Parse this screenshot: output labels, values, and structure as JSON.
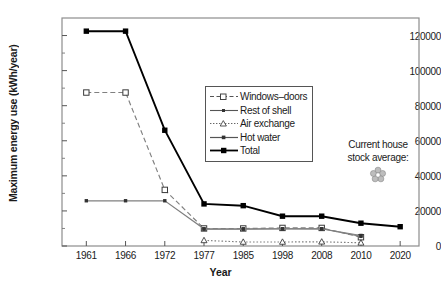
{
  "chart_data": {
    "type": "line",
    "title": "",
    "xlabel": "Year",
    "ylabel": "Maximum energy use (kWh/year)",
    "categories": [
      "1961",
      "1966",
      "1972",
      "1977",
      "1985",
      "1998",
      "2008",
      "2010",
      "2020"
    ],
    "ylim": [
      0,
      130000
    ],
    "yticks": [
      0,
      20000,
      40000,
      60000,
      80000,
      100000,
      120000
    ],
    "ytick_labels": [
      "0",
      "20000",
      "40000",
      "60000",
      "80000",
      "100000",
      "120000"
    ],
    "grid": false,
    "legend_position": "center",
    "series": [
      {
        "name": "Windows–doors",
        "marker": "open-square",
        "line_style": "dashed",
        "color": "#808080",
        "values": [
          87500,
          87500,
          32000,
          10000,
          10000,
          10300,
          10300,
          5000,
          null
        ]
      },
      {
        "name": "Rest of shell",
        "marker": "small-dot",
        "line_style": "solid",
        "color": "#808080",
        "values": [
          25800,
          25800,
          25800,
          9800,
          9800,
          9800,
          9800,
          6000,
          null
        ]
      },
      {
        "name": "Air exchange",
        "marker": "open-triangle",
        "line_style": "dotted",
        "color": "#808080",
        "values": [
          null,
          null,
          null,
          3200,
          2300,
          2300,
          2400,
          1800,
          null
        ]
      },
      {
        "name": "Hot water",
        "marker": "small-dot",
        "line_style": "solid",
        "color": "#808080",
        "values": [
          null,
          null,
          null,
          9600,
          9600,
          9800,
          9800,
          5500,
          null
        ]
      },
      {
        "name": "Total",
        "marker": "filled-square",
        "line_style": "solid",
        "color": "#000000",
        "values": [
          122500,
          122500,
          66000,
          24000,
          23000,
          17000,
          17000,
          13000,
          11000
        ]
      }
    ],
    "annotations": [
      {
        "text_line_1": "Current house",
        "text_line_2": "stock average:",
        "marker": "flower-icon"
      }
    ]
  },
  "legend": {
    "items": [
      {
        "label": "Windows–doors"
      },
      {
        "label": "Rest of shell"
      },
      {
        "label": "Air exchange"
      },
      {
        "label": "Hot water"
      },
      {
        "label": "Total"
      }
    ]
  }
}
